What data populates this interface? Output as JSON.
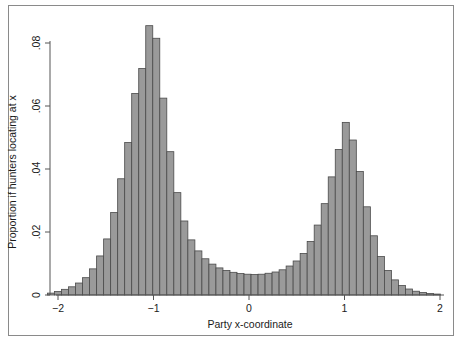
{
  "chart_data": {
    "type": "bar",
    "title": "",
    "subtitle": "",
    "xlabel": "Party x-coordinate",
    "ylabel": "Proportion if hunters locating at x",
    "xlim": [
      -2.15,
      2.15
    ],
    "ylim": [
      0,
      0.0905
    ],
    "xticks": [
      -2,
      -1,
      0,
      1,
      2
    ],
    "xticklabels": [
      "−2",
      "−1",
      "0",
      "1",
      "2"
    ],
    "yticks": [
      0,
      0.02,
      0.04,
      0.06,
      0.08
    ],
    "yticklabels": [
      "0",
      ".02",
      ".04",
      ".06",
      ".08"
    ],
    "grid": false,
    "legend": null,
    "bin_width": 0.0735,
    "bar_fill": "#9a9a9a",
    "bar_stroke": "#4a4a4a",
    "axis_color": "#555555",
    "frame_color": "#8a8a8a",
    "categories": [
      -2.0735,
      -2.0,
      -1.9265,
      -1.853,
      -1.7795,
      -1.706,
      -1.6325,
      -1.559,
      -1.4855,
      -1.412,
      -1.3385,
      -1.265,
      -1.1915,
      -1.118,
      -1.0445,
      -0.971,
      -0.8975,
      -0.824,
      -0.7505,
      -0.677,
      -0.6035,
      -0.53,
      -0.4565,
      -0.383,
      -0.3095,
      -0.236,
      -0.1625,
      -0.089,
      -0.0155,
      0.058,
      0.1315,
      0.205,
      0.2785,
      0.352,
      0.4255,
      0.499,
      0.5725,
      0.646,
      0.7195,
      0.793,
      0.8665,
      0.94,
      1.0135,
      1.087,
      1.1605,
      1.234,
      1.3075,
      1.381,
      1.4545,
      1.528,
      1.6015,
      1.675,
      1.7485,
      1.822,
      1.8955,
      1.969
    ],
    "values": [
      0.0006,
      0.0011,
      0.0018,
      0.0026,
      0.0038,
      0.0055,
      0.0083,
      0.0124,
      0.0178,
      0.0262,
      0.0369,
      0.0484,
      0.064,
      0.0719,
      0.0855,
      0.0815,
      0.0625,
      0.0455,
      0.0325,
      0.0235,
      0.0175,
      0.014,
      0.0115,
      0.0098,
      0.0086,
      0.0078,
      0.0072,
      0.0068,
      0.0066,
      0.0065,
      0.0066,
      0.0069,
      0.0073,
      0.008,
      0.0092,
      0.0108,
      0.0132,
      0.017,
      0.0222,
      0.029,
      0.0375,
      0.0462,
      0.0548,
      0.0492,
      0.0392,
      0.028,
      0.0188,
      0.0122,
      0.0078,
      0.0048,
      0.003,
      0.0019,
      0.0012,
      0.0008,
      0.0005,
      0.0003
    ]
  },
  "axis": {
    "xlabel": "Party x-coordinate",
    "ylabel": "Proportion if hunters locating at x"
  }
}
